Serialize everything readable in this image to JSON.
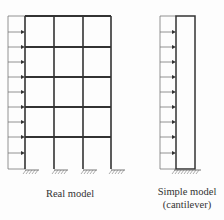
{
  "real_model": {
    "label": "Real model",
    "columns_x": [
      25,
      54,
      83,
      111
    ],
    "floors_y": [
      16,
      47,
      77,
      107,
      137
    ],
    "ground_y": 169,
    "load_box_left_x": 8,
    "arrows_y": [
      32,
      47,
      62,
      77,
      92,
      107,
      122,
      137,
      153
    ]
  },
  "simple_model": {
    "label_line1": "Simple model",
    "label_line2": "(cantilever)",
    "left_x": 176,
    "right_x": 195,
    "top_y": 16,
    "ground_y": 169,
    "load_box_left_x": 160,
    "arrows_y": [
      32,
      47,
      62,
      77,
      92,
      107,
      122,
      137,
      153
    ]
  },
  "colors": {
    "line": "#333333",
    "thin": "#777777"
  }
}
